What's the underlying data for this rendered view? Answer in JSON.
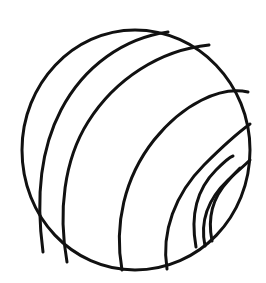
{
  "image": {
    "title": "Striped Ball",
    "subject": "ball",
    "style": "line-art coloring page",
    "background_color": "#ffffff",
    "ink_color": "#111111",
    "canvas": {
      "width": 266,
      "height": 283
    }
  },
  "artwork": {
    "outline": {
      "name": "ball-outline",
      "shape": "circle",
      "center_x": 135,
      "center_y": 150,
      "radius_x": 115,
      "radius_y": 120,
      "stroke_width": 3,
      "path": "M 135 30 C 73 30 22 84 22 150 C 22 217 72 270 135 270 C 199 270 250 217 250 150 C 250 84 198 30 135 30 Z"
    },
    "stripes": [
      {
        "name": "stripe-1",
        "stroke_width": 3,
        "path": "M 43 252 C 36 200 40 150 61 110 C 84 66 124 38 168 32"
      },
      {
        "name": "stripe-2",
        "stroke_width": 3,
        "path": "M 67 262 C 58 212 64 160 88 122 C 115 79 160 50 209 45"
      },
      {
        "name": "stripe-3",
        "stroke_width": 3,
        "path": "M 122 270 C 114 225 124 178 154 140 C 183 104 220 86 248 92"
      },
      {
        "name": "stripe-4",
        "stroke_width": 3,
        "path": "M 167 269 C 161 232 175 194 204 165 C 224 145 239 132 250 124"
      },
      {
        "name": "stripe-5",
        "stroke_width": 3,
        "path": "M 205 246 C 200 222 208 199 228 180 C 239 170 246 164 250 160"
      }
    ],
    "spiral_arcs": [
      {
        "name": "spiral-arc-outer",
        "stroke_width": 3,
        "path": "M 196 247 C 190 214 198 188 216 170 C 225 161 230 157 233 156"
      },
      {
        "name": "spiral-arc-inner",
        "stroke_width": 3,
        "path": "M 212 241 C 207 216 214 196 228 181 C 234 174 238 170 240 168"
      }
    ]
  }
}
